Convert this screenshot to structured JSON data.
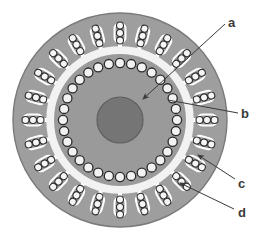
{
  "figure": {
    "kind": "motor-cross-section",
    "title": "",
    "background_color": "#ffffff"
  },
  "colors": {
    "stator_body": "#9e9e9e",
    "stator_edge": "#7a7a7a",
    "rotor_body": "#9a9a9a",
    "air_gap": "#f2f2f2",
    "shaft": "#757575",
    "shaft_edge": "#5f5f5f",
    "slot_fill": "#9e9e9e",
    "slot_outline": "#ffffff",
    "conductor_fill": "#f5f5f5",
    "conductor_outline": "#2e2e2e",
    "rotor_bar_fill": "#f2f2f2",
    "rotor_bar_outline": "#2b2b2b",
    "leader_line": "#3a3a3a",
    "label_text": "#3a3a3a"
  },
  "geometry": {
    "center_x": 120,
    "center_y": 120,
    "stator_outer_radius": 107,
    "stator_slot_count": 24,
    "conductors_per_slot": 3,
    "air_gap_outer_radius": 72,
    "air_gap_inner_radius": 66,
    "rotor_outer_radius": 66,
    "rotor_bar_count": 32,
    "rotor_bar_radius_position": 57,
    "rotor_bar_radius": 4.6,
    "shaft_radius": 23
  },
  "callouts": [
    {
      "id": "a",
      "label": "a",
      "meaning": "rotor-core",
      "text_x": 228,
      "text_y": 16,
      "line_x1": 225,
      "line_y1": 24,
      "line_x2": 143,
      "line_y2": 99,
      "arrow": true
    },
    {
      "id": "b",
      "label": "b",
      "meaning": "rotor-bar",
      "text_x": 241,
      "text_y": 107,
      "line_x1": 238,
      "line_y1": 113,
      "line_x2": 168,
      "line_y2": 100,
      "arrow": false
    },
    {
      "id": "c",
      "label": "c",
      "meaning": "stator-core",
      "text_x": 238,
      "text_y": 177,
      "line_x1": 235,
      "line_y1": 179,
      "line_x2": 198,
      "line_y2": 155,
      "arrow": true
    },
    {
      "id": "d",
      "label": "d",
      "meaning": "stator-winding-slot",
      "text_x": 238,
      "text_y": 206,
      "line_x1": 234,
      "line_y1": 209,
      "line_x2": 180,
      "line_y2": 183,
      "arrow": true
    }
  ],
  "watermark": {
    "text": "",
    "visible": false
  }
}
